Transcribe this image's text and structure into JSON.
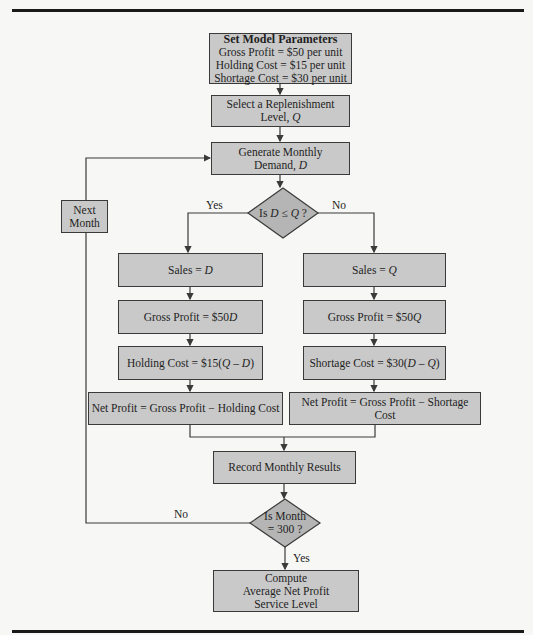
{
  "diagram": {
    "nodes": {
      "params": {
        "title": "Set Model Parameters",
        "lines": [
          "Gross Profit = $50 per unit",
          "Holding Cost = $15 per unit",
          "Shortage Cost = $30 per unit"
        ]
      },
      "select_q": {
        "line1": "Select a Replenishment",
        "line2_prefix": "Level, ",
        "line2_var": "Q"
      },
      "generate_d": {
        "line1": "Generate Monthly",
        "line2_prefix": "Demand, ",
        "line2_var": "D"
      },
      "decision_dq": {
        "prefix": "Is ",
        "var1": "D",
        "op": " ≤ ",
        "var2": "Q",
        "suffix": " ?"
      },
      "next_month": {
        "line1": "Next",
        "line2": "Month"
      },
      "sales_d": {
        "prefix": "Sales = ",
        "var": "D"
      },
      "gross_d": {
        "prefix": "Gross Profit = $50",
        "var": "D"
      },
      "holding": {
        "prefix": "Holding Cost = $15(",
        "expr": "Q – D",
        "suffix": ")"
      },
      "net_holding": {
        "text": "Net Profit = Gross Profit − Holding Cost"
      },
      "sales_q": {
        "prefix": "Sales = ",
        "var": "Q"
      },
      "gross_q": {
        "prefix": "Gross Profit = $50",
        "var": "Q"
      },
      "shortage": {
        "prefix": "Shortage Cost = $30(",
        "expr": "D – Q",
        "suffix": ")"
      },
      "net_shortage": {
        "text": "Net Profit = Gross Profit − Shortage Cost"
      },
      "record": {
        "text": "Record Monthly Results"
      },
      "decision_month": {
        "line1": "Is Month",
        "line2": "= 300 ?"
      },
      "compute": {
        "lines": [
          "Compute",
          "Average Net Profit",
          "Service Level"
        ]
      }
    },
    "edge_labels": {
      "dq_yes": "Yes",
      "dq_no": "No",
      "month_no": "No",
      "month_yes": "Yes"
    },
    "colors": {
      "box_fill": "#c9c9c9",
      "diamond_fill": "#b5b5b5",
      "stroke": "#3a3a3a",
      "background": "#f7f7f5"
    }
  }
}
